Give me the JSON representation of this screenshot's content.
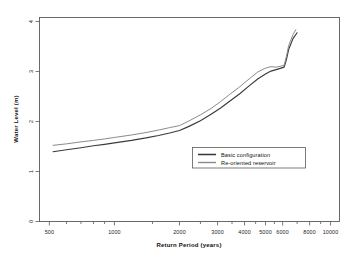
{
  "chart_data": {
    "type": "line",
    "title": "",
    "xlabel": "Return Period (years)",
    "ylabel": "Water Level (m)",
    "xscale": "log",
    "yscale": "linear",
    "xlim": [
      450,
      11000
    ],
    "ylim": [
      0,
      4.15
    ],
    "grid": false,
    "xticks": [
      500,
      1000,
      2000,
      3000,
      4000,
      5000,
      6000,
      8000,
      10000
    ],
    "xtick_labels": [
      "500",
      "1000",
      "2000",
      "3000",
      "4000",
      "5000",
      "6000",
      "8000",
      "10000"
    ],
    "yticks": [
      0,
      1,
      2,
      3,
      4
    ],
    "ytick_labels": [
      "0",
      "1",
      "2",
      "3",
      "4"
    ],
    "legend_position": "center-right",
    "series": [
      {
        "name": "Basic configuration",
        "color": "#3a3a3a",
        "linewidth": 1.15,
        "x": [
          520,
          600,
          700,
          800,
          900,
          1000,
          1200,
          1400,
          1600,
          1800,
          2000,
          2200,
          2500,
          2800,
          3100,
          3400,
          3800,
          4200,
          4600,
          5000,
          5300,
          5600,
          5900,
          6100,
          6250,
          6400,
          6700,
          7000
        ],
        "y": [
          1.42,
          1.46,
          1.5,
          1.54,
          1.57,
          1.6,
          1.65,
          1.7,
          1.75,
          1.8,
          1.85,
          1.93,
          2.05,
          2.18,
          2.31,
          2.44,
          2.6,
          2.76,
          2.9,
          3.0,
          3.06,
          3.09,
          3.12,
          3.14,
          3.3,
          3.5,
          3.72,
          3.84
        ]
      },
      {
        "name": "Re-oriented reservoir",
        "color": "#8a8a8a",
        "linewidth": 1.0,
        "x": [
          520,
          600,
          700,
          800,
          900,
          1000,
          1200,
          1400,
          1600,
          1800,
          2000,
          2200,
          2500,
          2800,
          3100,
          3400,
          3800,
          4200,
          4600,
          5000,
          5300,
          5600,
          5900,
          6100,
          6250,
          6400,
          6700,
          6900
        ],
        "y": [
          1.55,
          1.58,
          1.62,
          1.65,
          1.68,
          1.71,
          1.76,
          1.81,
          1.86,
          1.91,
          1.95,
          2.04,
          2.17,
          2.3,
          2.44,
          2.58,
          2.74,
          2.9,
          3.04,
          3.12,
          3.15,
          3.14,
          3.16,
          3.18,
          3.36,
          3.58,
          3.8,
          3.9
        ]
      }
    ]
  },
  "legend": {
    "entries": [
      {
        "label": "Basic configuration"
      },
      {
        "label": "Re-oriented reservoir"
      }
    ]
  },
  "axes": {
    "x_title": "Return Period (years)",
    "y_title": "Water Level (m)"
  }
}
